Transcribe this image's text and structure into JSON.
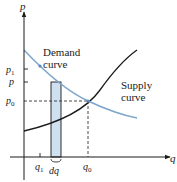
{
  "diagram": {
    "axes": {
      "y_label": "p",
      "x_label": "q"
    },
    "y_ticks": [
      {
        "label": "p",
        "sub": "1",
        "y": 69
      },
      {
        "label": "p",
        "sub": "",
        "y": 82
      },
      {
        "label": "p",
        "sub": "0",
        "y": 101
      }
    ],
    "x_ticks": [
      {
        "label": "q",
        "sub": "1",
        "x": 40
      },
      {
        "label": "dq",
        "sub": "",
        "x": 56
      },
      {
        "label": "q",
        "sub": "0",
        "x": 88
      }
    ],
    "curves": {
      "demand": {
        "label_line1": "Demand",
        "label_line2": "curve",
        "color": "#7fa6cc"
      },
      "supply": {
        "label_line1": "Supply",
        "label_line2": "curve",
        "color": "#1a1a1a"
      }
    },
    "strip": {
      "fill": "#cfe0f0",
      "stroke": "#1a1a1a"
    },
    "colors": {
      "axis": "#1a1a1a",
      "dashed": "#333333",
      "text": "#222222"
    }
  }
}
